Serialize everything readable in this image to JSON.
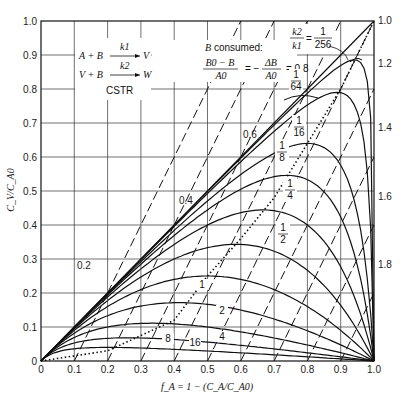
{
  "chart_data": {
    "type": "line",
    "title": "",
    "xlabel": "f_A = 1 − (C_A/C_A0)",
    "ylabel": "C_V/C_A0",
    "xlim": [
      0,
      1.0
    ],
    "ylim": [
      0,
      1.0
    ],
    "grid": true,
    "x_ticks": [
      "0",
      "0.1",
      "0.2",
      "0.3",
      "0.4",
      "0.5",
      "0.6",
      "0.7",
      "0.8",
      "0.9",
      "1.0"
    ],
    "y_ticks": [
      "0",
      "0.1",
      "0.2",
      "0.3",
      "0.4",
      "0.5",
      "0.6",
      "0.7",
      "0.8",
      "0.9",
      "1.0"
    ],
    "annotations": {
      "reaction_1": {
        "left": "A + B",
        "rate": "k1",
        "right": "V"
      },
      "reaction_2": {
        "left": "V + B",
        "rate": "k2",
        "right": "W"
      },
      "reactor": "CSTR",
      "b_consumed_title": "B consumed:",
      "b_consumed_eq_num": "B0 − B",
      "b_consumed_eq_den": "A0",
      "b_consumed_eq_mid": "= −",
      "b_consumed_eq_num2": "ΔB",
      "b_consumed_eq_den2": "A0",
      "b_consumed_first_value": "= 0.8",
      "ratio_label_num": "k2",
      "ratio_label_den": "k1",
      "ratio_label_eq": "=",
      "ratio_first": {
        "num": "1",
        "den": "256"
      }
    },
    "series_solid": [
      {
        "name": "k2/k1 = 0",
        "label": "",
        "K": 0
      },
      {
        "name": "k2/k1 = 1/256",
        "label": "1/256",
        "K": 0.00390625
      },
      {
        "name": "k2/k1 = 1/64",
        "label": "1/64",
        "K": 0.015625
      },
      {
        "name": "k2/k1 = 1/16",
        "label": "1/16",
        "K": 0.0625
      },
      {
        "name": "k2/k1 = 1/8",
        "label": "1/8",
        "K": 0.125
      },
      {
        "name": "k2/k1 = 1/4",
        "label": "1/4",
        "K": 0.25
      },
      {
        "name": "k2/k1 = 1/2",
        "label": "1/2",
        "K": 0.5
      },
      {
        "name": "k2/k1 = 1",
        "label": "1",
        "K": 1
      },
      {
        "name": "k2/k1 = 2",
        "label": "2",
        "K": 2
      },
      {
        "name": "k2/k1 = 4",
        "label": "4",
        "K": 4
      },
      {
        "name": "k2/k1 = 8",
        "label": "8",
        "K": 8
      },
      {
        "name": "k2/k1 = 16",
        "label": "16",
        "K": 16
      }
    ],
    "peak_values": [
      {
        "K": "1/16",
        "f": 0.8,
        "y": 0.64
      },
      {
        "K": "1/8",
        "f": 0.74,
        "y": 0.54
      },
      {
        "K": "1/4",
        "f": 0.67,
        "y": 0.44
      },
      {
        "K": "1/2",
        "f": 0.59,
        "y": 0.34
      },
      {
        "K": "1",
        "f": 0.5,
        "y": 0.25
      },
      {
        "K": "2",
        "f": 0.41,
        "y": 0.17
      },
      {
        "K": "4",
        "f": 0.33,
        "y": 0.11
      },
      {
        "K": "8",
        "f": 0.26,
        "y": 0.07
      },
      {
        "K": "16",
        "f": 0.2,
        "y": 0.04
      }
    ],
    "series_dashed_b_consumed": [
      {
        "label": "0.2",
        "b": 0.2
      },
      {
        "label": "0.4",
        "b": 0.4
      },
      {
        "label": "0.6",
        "b": 0.6
      },
      {
        "label": "0.8",
        "b": 0.8
      },
      {
        "label": "1.0",
        "b": 1.0
      },
      {
        "label": "1.2",
        "b": 1.2
      },
      {
        "label": "1.4",
        "b": 1.4
      },
      {
        "label": "1.6",
        "b": 1.6
      },
      {
        "label": "1.8",
        "b": 1.8
      }
    ],
    "series_dotted": {
      "name": "locus of maxima",
      "points": [
        [
          0,
          0
        ],
        [
          0.2,
          0.03
        ],
        [
          0.4,
          0.12
        ],
        [
          0.5,
          0.25
        ],
        [
          0.6,
          0.36
        ],
        [
          0.7,
          0.48
        ],
        [
          0.8,
          0.64
        ],
        [
          0.9,
          0.8
        ],
        [
          1.0,
          1.0
        ]
      ]
    },
    "right_labels": [
      "1.0",
      "1.2",
      "1.4",
      "1.6",
      "1.8"
    ]
  }
}
